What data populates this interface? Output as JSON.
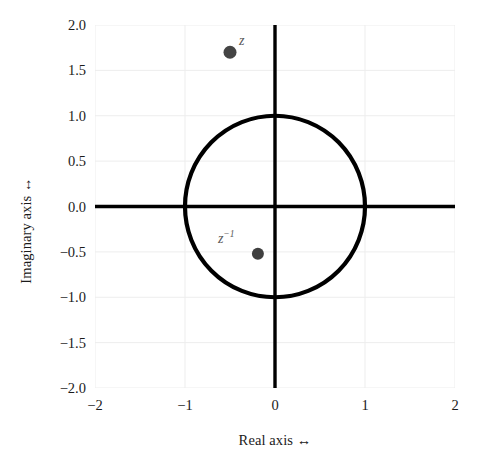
{
  "chart_data": {
    "type": "scatter",
    "title": "",
    "xlabel": "Real axis ↔",
    "ylabel": "Imaginary axis ↔",
    "xlim": [
      -2,
      2
    ],
    "ylim": [
      -2,
      2
    ],
    "grid": true,
    "legend": "none",
    "xticks": [
      "-2",
      "-1",
      "0",
      "1",
      "2"
    ],
    "xtick_values": [
      -2,
      -1,
      0,
      1,
      2
    ],
    "yticks": [
      "2.0",
      "1.5",
      "1.0",
      "0.5",
      "0.0",
      "-0.5",
      "-1.0",
      "-1.5",
      "-2.0"
    ],
    "ytick_values": [
      2.0,
      1.5,
      1.0,
      0.5,
      0.0,
      -0.5,
      -1.0,
      -1.5,
      -2.0
    ],
    "points": [
      {
        "name": "z",
        "label": "z",
        "label_sup": "",
        "x": -0.5,
        "y": 1.7,
        "color": "#444444",
        "marker": "circle",
        "marker_radius_px": 6.5,
        "label_dx_px": 9,
        "label_dy_px": -18
      },
      {
        "name": "z-inverse",
        "label": "z",
        "label_sup": "−1",
        "x": -0.19,
        "y": -0.52,
        "color": "#3f3f3f",
        "marker": "circle",
        "marker_radius_px": 6.0,
        "label_dx_px": -40,
        "label_dy_px": -22
      }
    ],
    "shapes": [
      {
        "name": "unit-circle",
        "type": "circle",
        "cx": 0,
        "cy": 0,
        "r": 1,
        "stroke": "#000000",
        "stroke_width_px": 4.2,
        "fill": "none"
      },
      {
        "name": "real-axis-line",
        "type": "hline",
        "y": 0,
        "stroke": "#000000",
        "stroke_width_px": 3.4
      },
      {
        "name": "imaginary-axis-line",
        "type": "vline",
        "x": 0,
        "stroke": "#000000",
        "stroke_width_px": 3.4
      }
    ],
    "colors": {
      "background": "#ffffff",
      "grid": "#ededed",
      "axis_line": "#000000",
      "text": "#1b1b1b",
      "label_text": "#5a5a5a"
    }
  }
}
